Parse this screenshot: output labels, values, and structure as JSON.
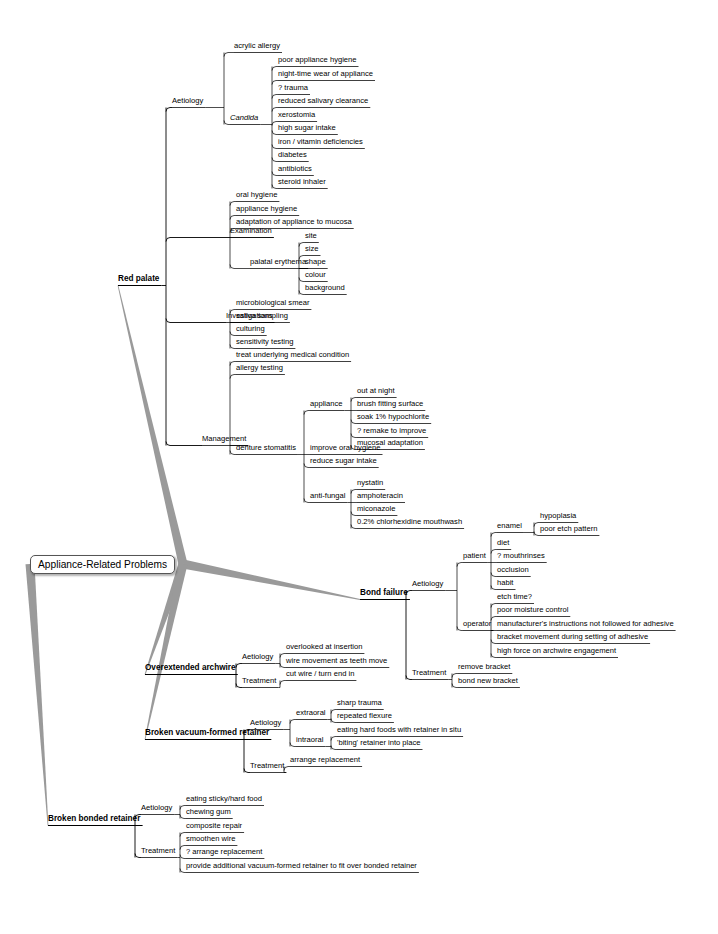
{
  "diagram": {
    "type": "mind-map",
    "root": {
      "label": "Appliance-Related Problems",
      "x": 30,
      "y": 563,
      "w": 153
    },
    "colors": {
      "root_branch": "#9a9a9a",
      "node_line": "#000000",
      "root_border": "#555555"
    },
    "branches": [
      {
        "label": "Red palate",
        "x": 118,
        "y": 283,
        "level": 1,
        "children": [
          {
            "label": "Aetiology",
            "x": 172,
            "y": 105,
            "children": [
              {
                "label": "acrylic allergy",
                "x": 234,
                "y": 50
              },
              {
                "label": "Candida",
                "x": 230,
                "y": 122,
                "italic": true,
                "children": [
                  {
                    "label": "poor appliance hygiene",
                    "x": 278,
                    "y": 64
                  },
                  {
                    "label": "night-time wear of appliance",
                    "x": 278,
                    "y": 78
                  },
                  {
                    "label": "? trauma",
                    "x": 278,
                    "y": 92
                  },
                  {
                    "label": "reduced salivary clearance",
                    "x": 278,
                    "y": 105
                  },
                  {
                    "label": "xerostomia",
                    "x": 278,
                    "y": 119
                  },
                  {
                    "label": "high sugar intake",
                    "x": 278,
                    "y": 132
                  },
                  {
                    "label": "iron / vitamin deficiencies",
                    "x": 278,
                    "y": 146
                  },
                  {
                    "label": "diabetes",
                    "x": 278,
                    "y": 159
                  },
                  {
                    "label": "antibiotics",
                    "x": 278,
                    "y": 173
                  },
                  {
                    "label": "steroid inhaler",
                    "x": 278,
                    "y": 186
                  }
                ]
              }
            ]
          },
          {
            "label": "Examination",
            "x": 230,
            "y": 235,
            "children": [
              {
                "label": "oral hygiene",
                "x": 236,
                "y": 199
              },
              {
                "label": "appliance hygiene",
                "x": 236,
                "y": 213
              },
              {
                "label": "adaptation of appliance to mucosa",
                "x": 236,
                "y": 226
              },
              {
                "label": "palatal erythema",
                "x": 250,
                "y": 266,
                "children": [
                  {
                    "label": "site",
                    "x": 305,
                    "y": 240
                  },
                  {
                    "label": "size",
                    "x": 305,
                    "y": 253
                  },
                  {
                    "label": "shape",
                    "x": 305,
                    "y": 266
                  },
                  {
                    "label": "colour",
                    "x": 305,
                    "y": 279
                  },
                  {
                    "label": "background",
                    "x": 305,
                    "y": 292
                  }
                ]
              }
            ]
          },
          {
            "label": "Investigations",
            "x": 226,
            "y": 320,
            "children": [
              {
                "label": "microbiological smear",
                "x": 236,
                "y": 307
              },
              {
                "label": "saliva sampling",
                "x": 236,
                "y": 320
              },
              {
                "label": "culturing",
                "x": 236,
                "y": 333
              },
              {
                "label": "sensitivity testing",
                "x": 236,
                "y": 346
              }
            ]
          },
          {
            "label": "Management",
            "x": 202,
            "y": 443,
            "children": [
              {
                "label": "treat underlying medical condition",
                "x": 236,
                "y": 359
              },
              {
                "label": "allergy testing",
                "x": 236,
                "y": 372
              },
              {
                "label": "denture stomatitis",
                "x": 236,
                "y": 452,
                "children": [
                  {
                    "label": "appliance",
                    "x": 310,
                    "y": 408,
                    "children": [
                      {
                        "label": "out at night",
                        "x": 357,
                        "y": 395
                      },
                      {
                        "label": "brush fitting surface",
                        "x": 357,
                        "y": 408
                      },
                      {
                        "label": "soak 1% hypochlorite",
                        "x": 357,
                        "y": 421
                      },
                      {
                        "label": "? remake to improve",
                        "x": 357,
                        "y": 435
                      },
                      {
                        "label": "mucosal adaptation",
                        "x": 357,
                        "y": 447
                      }
                    ]
                  },
                  {
                    "label": "improve oral hygiene",
                    "x": 310,
                    "y": 452
                  },
                  {
                    "label": "reduce sugar intake",
                    "x": 310,
                    "y": 465
                  },
                  {
                    "label": "anti-fungal",
                    "x": 310,
                    "y": 500,
                    "children": [
                      {
                        "label": "nystatin",
                        "x": 357,
                        "y": 487
                      },
                      {
                        "label": "amphoteracin",
                        "x": 357,
                        "y": 500
                      },
                      {
                        "label": "miconazole",
                        "x": 357,
                        "y": 513
                      },
                      {
                        "label": "0.2% chlorhexidine mouthwash",
                        "x": 357,
                        "y": 526
                      }
                    ]
                  }
                ]
              }
            ]
          }
        ]
      },
      {
        "label": "Bond failure",
        "x": 360,
        "y": 597,
        "level": 1,
        "children": [
          {
            "label": "Aetiology",
            "x": 412,
            "y": 588,
            "children": [
              {
                "label": "patient",
                "x": 463,
                "y": 560,
                "children": [
                  {
                    "label": "enamel",
                    "x": 497,
                    "y": 530,
                    "children": [
                      {
                        "label": "hypoplasia",
                        "x": 540,
                        "y": 520
                      },
                      {
                        "label": "poor etch pattern",
                        "x": 540,
                        "y": 533
                      }
                    ]
                  },
                  {
                    "label": "diet",
                    "x": 497,
                    "y": 547
                  },
                  {
                    "label": "? mouthrinses",
                    "x": 497,
                    "y": 560
                  },
                  {
                    "label": "occlusion",
                    "x": 497,
                    "y": 574
                  },
                  {
                    "label": "habit",
                    "x": 497,
                    "y": 587
                  }
                ]
              },
              {
                "label": "operator",
                "x": 463,
                "y": 628,
                "children": [
                  {
                    "label": "etch time?",
                    "x": 497,
                    "y": 601
                  },
                  {
                    "label": "poor moisture control",
                    "x": 497,
                    "y": 614
                  },
                  {
                    "label": "manufacturer's instructions not followed for adhesive",
                    "x": 497,
                    "y": 628
                  },
                  {
                    "label": "bracket movement during setting of adhesive",
                    "x": 497,
                    "y": 641
                  },
                  {
                    "label": "high force on archwire engagement",
                    "x": 497,
                    "y": 655
                  }
                ]
              }
            ]
          },
          {
            "label": "Treatment",
            "x": 412,
            "y": 677,
            "children": [
              {
                "label": "remove bracket",
                "x": 458,
                "y": 671
              },
              {
                "label": "bond new bracket",
                "x": 458,
                "y": 685
              }
            ]
          }
        ]
      },
      {
        "label": "Overextended archwire",
        "x": 145,
        "y": 672,
        "level": 1,
        "children": [
          {
            "label": "Aetiology",
            "x": 242,
            "y": 661,
            "children": [
              {
                "label": "overlooked at insertion",
                "x": 286,
                "y": 651
              },
              {
                "label": "wire movement as teeth move",
                "x": 286,
                "y": 665
              }
            ]
          },
          {
            "label": "Treatment",
            "x": 242,
            "y": 685,
            "children": [
              {
                "label": "cut wire / turn end in",
                "x": 286,
                "y": 678
              }
            ]
          }
        ]
      },
      {
        "label": "Broken vacuum-formed retainer",
        "x": 145,
        "y": 737,
        "level": 1,
        "children": [
          {
            "label": "Aetiology",
            "x": 250,
            "y": 727,
            "children": [
              {
                "label": "extraoral",
                "x": 296,
                "y": 717,
                "children": [
                  {
                    "label": "sharp trauma",
                    "x": 337,
                    "y": 707
                  },
                  {
                    "label": "repeated flexure",
                    "x": 337,
                    "y": 720
                  }
                ]
              },
              {
                "label": "intraoral",
                "x": 296,
                "y": 744,
                "children": [
                  {
                    "label": "eating hard foods with retainer in situ",
                    "x": 337,
                    "y": 734
                  },
                  {
                    "label": "'biting' retainer into place",
                    "x": 337,
                    "y": 747
                  }
                ]
              }
            ]
          },
          {
            "label": "Treatment",
            "x": 250,
            "y": 770,
            "children": [
              {
                "label": "arrange replacement",
                "x": 290,
                "y": 764
              }
            ]
          }
        ]
      },
      {
        "label": "Broken bonded retainer",
        "x": 48,
        "y": 823,
        "level": 1,
        "children": [
          {
            "label": "Aetiology",
            "x": 141,
            "y": 812,
            "children": [
              {
                "label": "eating sticky/hard food",
                "x": 186,
                "y": 803
              },
              {
                "label": "chewing gum",
                "x": 186,
                "y": 816
              }
            ]
          },
          {
            "label": "Treatment",
            "x": 141,
            "y": 855,
            "children": [
              {
                "label": "composite repair",
                "x": 186,
                "y": 830
              },
              {
                "label": "smoothen wire",
                "x": 186,
                "y": 843
              },
              {
                "label": "? arrange replacement",
                "x": 186,
                "y": 856
              },
              {
                "label": "provide additional vacuum-formed retainer to fit over bonded retainer",
                "x": 186,
                "y": 870
              }
            ]
          }
        ]
      }
    ]
  }
}
